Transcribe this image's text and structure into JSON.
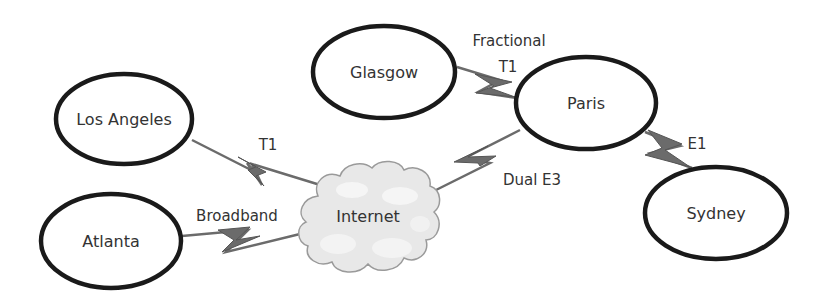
{
  "diagram": {
    "type": "network-topology",
    "colors": {
      "node_stroke": "#1a1a1a",
      "link": "#6b6b6b",
      "cloud_fill": "#e6e6e6",
      "cloud_stroke": "#9a9a9a",
      "text": "#333333"
    },
    "nodes": [
      {
        "id": "los-angeles",
        "label": "Los Angeles"
      },
      {
        "id": "atlanta",
        "label": "Atlanta"
      },
      {
        "id": "glasgow",
        "label": "Glasgow"
      },
      {
        "id": "paris",
        "label": "Paris"
      },
      {
        "id": "sydney",
        "label": "Sydney"
      },
      {
        "id": "internet",
        "label": "Internet",
        "shape": "cloud"
      }
    ],
    "links": [
      {
        "from": "los-angeles",
        "to": "internet",
        "label": "T1"
      },
      {
        "from": "atlanta",
        "to": "internet",
        "label": "Broadband"
      },
      {
        "from": "internet",
        "to": "paris",
        "label": "Dual E3"
      },
      {
        "from": "glasgow",
        "to": "paris",
        "label_line1": "Fractional",
        "label_line2": "T1"
      },
      {
        "from": "paris",
        "to": "sydney",
        "label": "E1"
      }
    ]
  }
}
